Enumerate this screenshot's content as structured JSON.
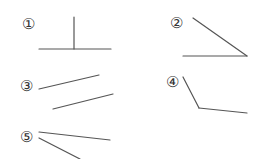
{
  "colors": {
    "line": "#555555",
    "label": "#333333",
    "background": "#ffffff"
  },
  "figures": [
    {
      "id": 1,
      "label": "①",
      "label_pos": [
        28,
        24
      ],
      "segments": [
        {
          "x1": 74,
          "y1": 17,
          "x2": 74,
          "y2": 49
        },
        {
          "x1": 39,
          "y1": 49,
          "x2": 111,
          "y2": 49
        }
      ]
    },
    {
      "id": 2,
      "label": "②",
      "label_pos": [
        176,
        23
      ],
      "segments": [
        {
          "x1": 193,
          "y1": 18,
          "x2": 247,
          "y2": 56
        },
        {
          "x1": 183,
          "y1": 56,
          "x2": 247,
          "y2": 56
        }
      ]
    },
    {
      "id": 3,
      "label": "③",
      "label_pos": [
        26,
        86
      ],
      "segments": [
        {
          "x1": 39,
          "y1": 89,
          "x2": 99,
          "y2": 75
        },
        {
          "x1": 53,
          "y1": 109,
          "x2": 113,
          "y2": 94
        }
      ]
    },
    {
      "id": 4,
      "label": "④",
      "label_pos": [
        172,
        82
      ],
      "segments": [
        {
          "x1": 183,
          "y1": 77,
          "x2": 199,
          "y2": 108
        },
        {
          "x1": 199,
          "y1": 108,
          "x2": 247,
          "y2": 113
        }
      ]
    },
    {
      "id": 5,
      "label": "⑤",
      "label_pos": [
        26,
        137
      ],
      "segments": [
        {
          "x1": 39,
          "y1": 132,
          "x2": 110,
          "y2": 140
        },
        {
          "x1": 39,
          "y1": 138,
          "x2": 80,
          "y2": 159
        }
      ]
    }
  ]
}
